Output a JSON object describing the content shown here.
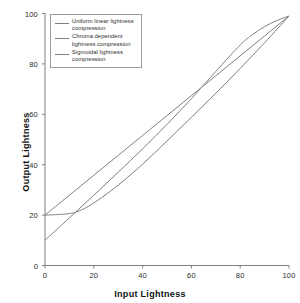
{
  "chart_data": {
    "type": "line",
    "title": "",
    "xlabel": "Input Lightness",
    "ylabel": "Output Lightness",
    "xlim": [
      0,
      100
    ],
    "ylim": [
      0,
      100
    ],
    "xticks": [
      0,
      20,
      40,
      60,
      80,
      100
    ],
    "yticks": [
      0,
      20,
      40,
      60,
      80,
      100
    ],
    "grid": false,
    "legend_position": "upper-left-inside",
    "line_color": "#808080",
    "axis_color": "#808080",
    "series": [
      {
        "name": "Uniform linear lightness compression",
        "color": "#808080",
        "x": [
          0,
          10,
          20,
          30,
          40,
          50,
          60,
          70,
          80,
          90,
          100
        ],
        "values": [
          20,
          27.9,
          35.8,
          43.7,
          51.6,
          59.5,
          67.4,
          75.3,
          83.2,
          91.1,
          99
        ]
      },
      {
        "name": "Chroma dependent lightness compression",
        "color": "#808080",
        "x": [
          0,
          5,
          10,
          13,
          18,
          25,
          32,
          40,
          50,
          60,
          70,
          80,
          90,
          100
        ],
        "values": [
          20,
          20.2,
          20.6,
          21.3,
          23.6,
          28.2,
          33.5,
          40.2,
          49.4,
          58.8,
          68.4,
          78.2,
          88.4,
          99
        ]
      },
      {
        "name": "Sigmoidal lightness compression",
        "color": "#808080",
        "x": [
          0,
          10,
          20,
          30,
          40,
          50,
          60,
          70,
          80,
          85,
          90,
          95,
          100
        ],
        "values": [
          10,
          18.9,
          27.9,
          37.0,
          46.3,
          56.0,
          66.2,
          77.0,
          87.5,
          91.6,
          94.8,
          97.2,
          99
        ]
      }
    ]
  },
  "legend": {
    "entries": [
      {
        "label_line1": "Uniform linear lightness",
        "label_line2": "compression"
      },
      {
        "label_line1": "Chroma dependent",
        "label_line2": "lightness compression"
      },
      {
        "label_line1": "Sigmoidal lightness",
        "label_line2": "compression"
      }
    ]
  },
  "axes": {
    "x_title": "Input Lightness",
    "y_title": "Output Lightness",
    "x_tick_labels": [
      "0",
      "20",
      "40",
      "60",
      "80",
      "100"
    ],
    "y_tick_labels": [
      "0",
      "20",
      "40",
      "60",
      "80",
      "100"
    ]
  }
}
